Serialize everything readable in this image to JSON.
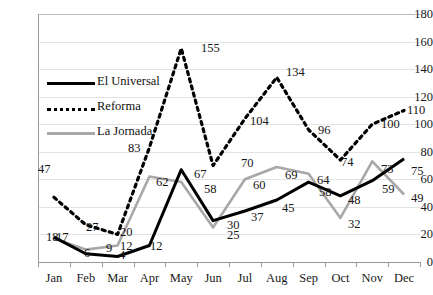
{
  "chart_data": {
    "type": "line",
    "title": "",
    "xlabel": "",
    "ylabel": "",
    "ylim": [
      0,
      180
    ],
    "ytick_step": 20,
    "grid": true,
    "legend_position": "inside-upper-left",
    "categories": [
      "Jan",
      "Feb",
      "Mar",
      "Apr",
      "May",
      "Jun",
      "Jul",
      "Aug",
      "Sep",
      "Oct",
      "Nov",
      "Dec"
    ],
    "yticks": [
      "0",
      "20",
      "40",
      "60",
      "80",
      "100",
      "120",
      "140",
      "160",
      "180"
    ],
    "series": [
      {
        "name": "El Universal",
        "style": "solid",
        "color": "#000000",
        "values": [
          18,
          6,
          4,
          12,
          67,
          30,
          37,
          45,
          58,
          48,
          59,
          75
        ],
        "labels": [
          "18",
          "6",
          "4",
          "12",
          "67",
          "30",
          "37",
          "45",
          "58",
          "48",
          "59",
          "75"
        ]
      },
      {
        "name": "Reforma",
        "style": "dashed",
        "color": "#000000",
        "values": [
          47,
          27,
          20,
          83,
          155,
          70,
          104,
          134,
          96,
          74,
          100,
          110
        ],
        "labels": [
          "47",
          "27",
          "20",
          "83",
          "155",
          "70",
          "104",
          "134",
          "96",
          "74",
          "100",
          "110"
        ]
      },
      {
        "name": "La Jornada",
        "style": "solid",
        "color": "#A8A8A8",
        "values": [
          17,
          9,
          12,
          62,
          58,
          25,
          60,
          69,
          64,
          32,
          73,
          49
        ],
        "labels": [
          "17",
          "9",
          "12",
          "62",
          "58",
          "25",
          "60",
          "69",
          "64",
          "32",
          "73",
          "49"
        ]
      }
    ],
    "data_labels": [
      {
        "text": "47",
        "x": 38,
        "y": 163,
        "series": "Reforma"
      },
      {
        "text": "27",
        "x": 86,
        "y": 221,
        "series": "Reforma"
      },
      {
        "text": "20",
        "x": 120,
        "y": 226,
        "series": "Reforma"
      },
      {
        "text": "83",
        "x": 128,
        "y": 142,
        "series": "Reforma"
      },
      {
        "text": "155",
        "x": 201,
        "y": 42,
        "series": "Reforma"
      },
      {
        "text": "70",
        "x": 241,
        "y": 157,
        "series": "Reforma"
      },
      {
        "text": "104",
        "x": 250,
        "y": 115,
        "series": "Reforma"
      },
      {
        "text": "134",
        "x": 286,
        "y": 66,
        "series": "Reforma"
      },
      {
        "text": "96",
        "x": 318,
        "y": 124,
        "series": "Reforma"
      },
      {
        "text": "74",
        "x": 341,
        "y": 156,
        "series": "Reforma"
      },
      {
        "text": "100",
        "x": 381,
        "y": 118,
        "series": "Reforma"
      },
      {
        "text": "110",
        "x": 407,
        "y": 104,
        "series": "Reforma"
      },
      {
        "text": "18",
        "x": 46,
        "y": 231,
        "series": "El Universal"
      },
      {
        "text": "6",
        "x": 84,
        "y": 247,
        "series": "El Universal"
      },
      {
        "text": "4",
        "x": 119,
        "y": 249,
        "series": "El Universal"
      },
      {
        "text": "12",
        "x": 150,
        "y": 240,
        "series": "El Universal"
      },
      {
        "text": "67",
        "x": 194,
        "y": 168,
        "series": "El Universal"
      },
      {
        "text": "30",
        "x": 227,
        "y": 219,
        "series": "El Universal"
      },
      {
        "text": "37",
        "x": 251,
        "y": 211,
        "series": "El Universal"
      },
      {
        "text": "45",
        "x": 282,
        "y": 202,
        "series": "El Universal"
      },
      {
        "text": "58",
        "x": 319,
        "y": 186,
        "series": "El Universal"
      },
      {
        "text": "48",
        "x": 348,
        "y": 194,
        "series": "El Universal"
      },
      {
        "text": "59",
        "x": 382,
        "y": 183,
        "series": "El Universal"
      },
      {
        "text": "75",
        "x": 411,
        "y": 165,
        "series": "El Universal"
      },
      {
        "text": "17",
        "x": 56,
        "y": 231,
        "series": "La Jornada"
      },
      {
        "text": "9",
        "x": 106,
        "y": 242,
        "series": "La Jornada"
      },
      {
        "text": "12",
        "x": 120,
        "y": 240,
        "series": "La Jornada"
      },
      {
        "text": "62",
        "x": 156,
        "y": 176,
        "series": "La Jornada"
      },
      {
        "text": "58",
        "x": 204,
        "y": 183,
        "series": "La Jornada"
      },
      {
        "text": "25",
        "x": 227,
        "y": 229,
        "series": "La Jornada"
      },
      {
        "text": "60",
        "x": 253,
        "y": 179,
        "series": "La Jornada"
      },
      {
        "text": "69",
        "x": 285,
        "y": 169,
        "series": "La Jornada"
      },
      {
        "text": "64",
        "x": 317,
        "y": 174,
        "series": "La Jornada"
      },
      {
        "text": "32",
        "x": 348,
        "y": 218,
        "series": "La Jornada"
      },
      {
        "text": "73",
        "x": 381,
        "y": 163,
        "series": "La Jornada"
      },
      {
        "text": "49",
        "x": 411,
        "y": 192,
        "series": "La Jornada"
      }
    ]
  }
}
